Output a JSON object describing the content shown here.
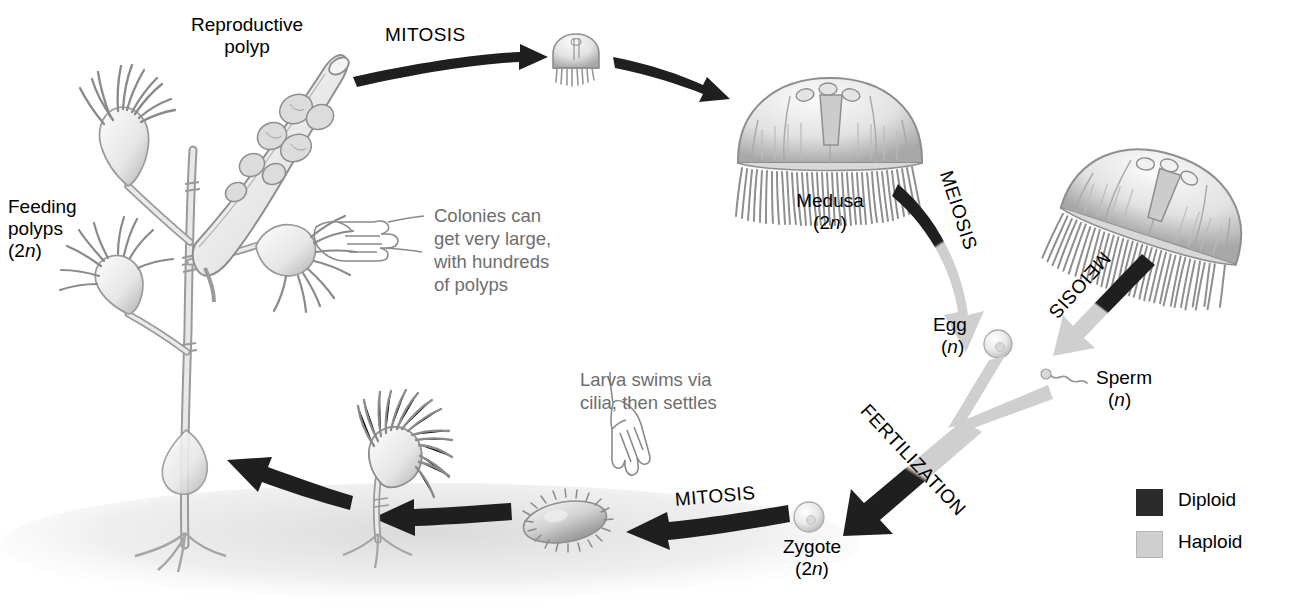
{
  "figure": {
    "background": "#ffffff"
  },
  "colors": {
    "diploid": "#1f1f1f",
    "haploid": "#cfcfcf",
    "callout_text": "#6e6e6e",
    "label_text": "#000000",
    "organism_ink": "#8a8a8a",
    "substrate_shadow": "#dcdcdc"
  },
  "labels": {
    "reproductive_polyp": "Reproductive\npolyp",
    "feeding_polyps_name": "Feeding\npolyps",
    "feeding_polyps_ploidy": "(2n)",
    "medusa_name": "Medusa",
    "medusa_ploidy": "(2n)",
    "egg_name": "Egg",
    "egg_ploidy": "(n)",
    "sperm_name": "Sperm",
    "sperm_ploidy": "(n)",
    "zygote_name": "Zygote",
    "zygote_ploidy": "(2n)"
  },
  "process_arrows": [
    {
      "id": "mitosis-budding",
      "label": "MITOSIS",
      "ploidy": "diploid"
    },
    {
      "id": "medusa-growth",
      "label": "",
      "ploidy": "diploid"
    },
    {
      "id": "meiosis-egg",
      "label": "MEIOSIS",
      "ploidy": "diploid-to-haploid"
    },
    {
      "id": "meiosis-sperm",
      "label": "MEIOSIS",
      "ploidy": "diploid-to-haploid"
    },
    {
      "id": "fertilization",
      "label": "FERTILIZATION",
      "ploidy": "haploid-to-diploid"
    },
    {
      "id": "mitosis-larva",
      "label": "MITOSIS",
      "ploidy": "diploid"
    },
    {
      "id": "larva-to-polyp",
      "label": "",
      "ploidy": "diploid"
    },
    {
      "id": "polyp-to-colony",
      "label": "",
      "ploidy": "diploid"
    }
  ],
  "callouts": [
    {
      "id": "colony-size",
      "text": "Colonies can\nget very large,\nwith hundreds\nof polyps",
      "icon": "pointing-hand-left-icon"
    },
    {
      "id": "larva-behavior",
      "text": "Larva swims via\ncilia, then settles",
      "icon": "pointing-hand-down-icon"
    }
  ],
  "legend": {
    "items": [
      {
        "label": "Diploid",
        "color": "#2b2b2b"
      },
      {
        "label": "Haploid",
        "color": "#cfcfcf"
      }
    ]
  },
  "organisms": [
    {
      "id": "hydroid-colony",
      "name": "colonial hydroid with feeding and reproductive polyps"
    },
    {
      "id": "medusa-bud",
      "name": "newly budded juvenile medusa"
    },
    {
      "id": "medusa-large",
      "name": "mature medusa"
    },
    {
      "id": "medusa-right",
      "name": "mature medusa producing sperm"
    },
    {
      "id": "egg-cell",
      "name": "egg"
    },
    {
      "id": "sperm-cell",
      "name": "sperm with flagellum"
    },
    {
      "id": "zygote-cell",
      "name": "zygote"
    },
    {
      "id": "planula-larva",
      "name": "ciliated planula larva"
    },
    {
      "id": "young-polyp",
      "name": "settled young polyp"
    }
  ]
}
